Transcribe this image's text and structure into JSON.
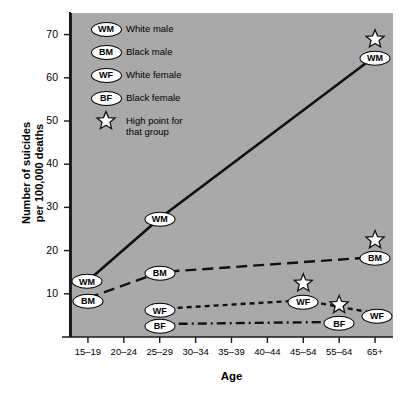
{
  "chart_data": {
    "type": "line",
    "title": "",
    "xlabel": "Age",
    "ylabel": "Number of suicides\nper 100,000 deaths",
    "categories": [
      "15–19",
      "20–24",
      "25–29",
      "30–34",
      "35–39",
      "40–44",
      "45–54",
      "55–64",
      "65+"
    ],
    "yticks": [
      10,
      20,
      30,
      40,
      50,
      60,
      70
    ],
    "ylim": [
      0,
      75
    ],
    "grid": false,
    "legend_position": "inside-top-left",
    "series": [
      {
        "name": "WM",
        "label": "White male",
        "linestyle": "solid",
        "points": [
          {
            "x": "15–19",
            "y": 13,
            "label": "WM",
            "show_label": true,
            "star": false
          },
          {
            "x": "25–29",
            "y": 27.5,
            "label": "WM",
            "show_label": true,
            "star": false
          },
          {
            "x": "65+",
            "y": 65,
            "label": "WM",
            "show_label": true,
            "star": true
          }
        ]
      },
      {
        "name": "BM",
        "label": "Black male",
        "linestyle": "dashed",
        "points": [
          {
            "x": "15–19",
            "y": 9,
            "label": "BM",
            "show_label": true,
            "star": false
          },
          {
            "x": "25–29",
            "y": 15,
            "label": "BM",
            "show_label": true,
            "star": false
          },
          {
            "x": "65+",
            "y": 18.5,
            "label": "BM",
            "show_label": true,
            "star": true
          }
        ]
      },
      {
        "name": "WF",
        "label": "White female",
        "linestyle": "dotted",
        "points": [
          {
            "x": "25–29",
            "y": 6.5,
            "label": "WF",
            "show_label": true,
            "star": false
          },
          {
            "x": "45–54",
            "y": 8.5,
            "label": "WF",
            "show_label": true,
            "star": true
          },
          {
            "x": "65+",
            "y": 5.5,
            "label": "WF",
            "show_label": true,
            "star": false
          }
        ]
      },
      {
        "name": "BF",
        "label": "Black female",
        "linestyle": "dashdot",
        "points": [
          {
            "x": "25–29",
            "y": 3,
            "label": "BF",
            "show_label": true,
            "star": false
          },
          {
            "x": "55–64",
            "y": 3.5,
            "label": "BF",
            "show_label": true,
            "star": true
          }
        ]
      }
    ],
    "annotations": {
      "star_meaning": "High point for that group"
    }
  },
  "legend": {
    "items": [
      {
        "key": "WM",
        "text": "White male"
      },
      {
        "key": "BM",
        "text": "Black male"
      },
      {
        "key": "WF",
        "text": "White female"
      },
      {
        "key": "BF",
        "text": "Black female"
      },
      {
        "key": "star",
        "text": "High point for\nthat group"
      }
    ]
  },
  "axes": {
    "y_title": "Number of suicides\nper 100,000 deaths",
    "x_title": "Age",
    "y_tick_labels": [
      "70",
      "60",
      "50",
      "40",
      "30",
      "20",
      "10"
    ],
    "x_tick_labels": [
      "15–19",
      "20–24",
      "25–29",
      "30–34",
      "35–39",
      "40–44",
      "45–54",
      "55–64",
      "65+"
    ]
  },
  "colors": {
    "panel_background": "#a9a9a9",
    "page_background": "#ffffff",
    "line": "#111111",
    "marker_fill": "#ffffff",
    "text": "#000000"
  }
}
